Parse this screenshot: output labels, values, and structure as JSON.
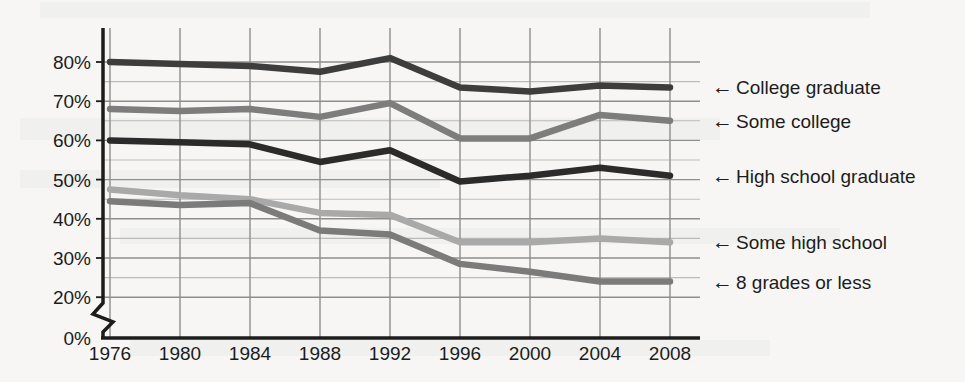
{
  "figure": {
    "background_color": "#f7f6f4",
    "axis_color": "#1c1c1c",
    "gridline_color": "#8e8e8e",
    "axis_break_present": true,
    "axis_break_label": "axis-break-zigzag"
  },
  "chart_data": {
    "type": "line",
    "title": "",
    "subtitle": "",
    "xlabel": "",
    "ylabel": "",
    "x": [
      1976,
      1980,
      1984,
      1988,
      1992,
      1996,
      2000,
      2004,
      2008
    ],
    "categories": [
      "1976",
      "1980",
      "1984",
      "1988",
      "1992",
      "1996",
      "2000",
      "2004",
      "2008"
    ],
    "xticklabels": [
      "1976",
      "1980",
      "1984",
      "1988",
      "1992",
      "1996",
      "2000",
      "2004",
      "2008"
    ],
    "yticklabels": [
      "0%",
      "20%",
      "30%",
      "40%",
      "50%",
      "60%",
      "70%",
      "80%"
    ],
    "ytickvalues": [
      0,
      20,
      30,
      40,
      50,
      60,
      70,
      80
    ],
    "ylim": [
      20,
      85
    ],
    "xlim": [
      1976,
      2008
    ],
    "grid": true,
    "legend_position": "right-inline-arrows",
    "value_unit": "%",
    "series": [
      {
        "name": "College graduate",
        "color": "#3d3d3d",
        "label": "College graduate",
        "arrow": "←",
        "values": [
          80,
          79.5,
          79,
          77.5,
          81,
          73.5,
          72.5,
          74,
          73.5
        ]
      },
      {
        "name": "Some college",
        "color": "#7d7d7d",
        "label": "Some college",
        "arrow": "←",
        "values": [
          68,
          67.5,
          68,
          66,
          69.5,
          60.5,
          60.5,
          66.5,
          65
        ]
      },
      {
        "name": "High school graduate",
        "color": "#2b2b2b",
        "label": "High school graduate",
        "arrow": "←",
        "values": [
          60,
          59.5,
          59,
          54.5,
          57.5,
          49.5,
          51,
          53,
          51
        ]
      },
      {
        "name": "Some high school",
        "color": "#a9a9a9",
        "label": "Some high school",
        "arrow": "←",
        "values": [
          47.5,
          46,
          45,
          41.5,
          41,
          34,
          34,
          35,
          34
        ]
      },
      {
        "name": "8 grades or less",
        "color": "#7b7b7b",
        "label": "8 grades or less",
        "arrow": "←",
        "values": [
          44.5,
          43.5,
          44,
          37,
          36,
          28.5,
          26.5,
          24,
          24
        ]
      }
    ]
  }
}
